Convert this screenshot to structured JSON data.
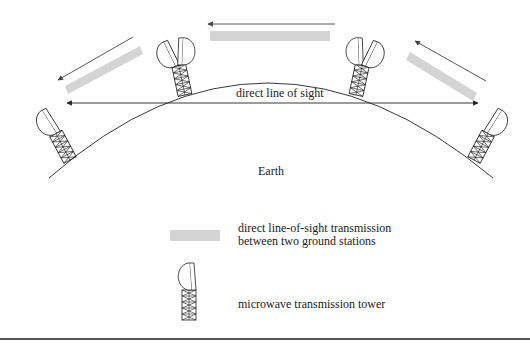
{
  "diagram": {
    "labels": {
      "line_of_sight": "direct line of sight",
      "earth": "Earth"
    },
    "legend": [
      {
        "symbol": "grey-bar",
        "text_line1": "direct line-of-sight transmission",
        "text_line2": "between two ground stations"
      },
      {
        "symbol": "microwave-tower",
        "text_line1": "microwave transmission tower"
      }
    ],
    "colors": {
      "transmission_bar": "#d4d4d4",
      "arrow": "#555555",
      "line": "#222222",
      "rule": "#555555"
    },
    "towers": [
      {
        "name": "left-end-tower",
        "dishes": 1
      },
      {
        "name": "relay-tower-left",
        "dishes": 2
      },
      {
        "name": "relay-tower-right",
        "dishes": 2
      },
      {
        "name": "right-end-tower",
        "dishes": 1
      }
    ]
  }
}
